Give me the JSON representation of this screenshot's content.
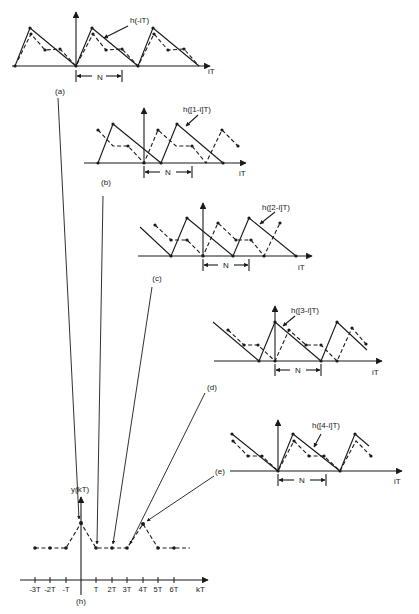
{
  "panels": [
    {
      "id": "a",
      "tag": "(a)",
      "label": "h(-iT)",
      "axis": "iT",
      "period": "N"
    },
    {
      "id": "b",
      "tag": "(b)",
      "label": "h([1-i]T)",
      "axis": "iT",
      "period": "N"
    },
    {
      "id": "c",
      "tag": "(c)",
      "label": "h([2-i]T)",
      "axis": "iT",
      "period": "N"
    },
    {
      "id": "d",
      "tag": "(d)",
      "label": "h([3-i]T)",
      "axis": "iT",
      "period": "N"
    },
    {
      "id": "e",
      "tag": "(e)",
      "label": "h([4-i]T)",
      "axis": "iT",
      "period": "N"
    }
  ],
  "output": {
    "tag": "(h)",
    "ylabel": "y(kT)",
    "xlabel": "kT",
    "ticks": [
      "-3T",
      "-2T",
      "-T",
      "T",
      "2T",
      "3T",
      "4T",
      "5T",
      "6T"
    ]
  },
  "colors": {
    "ink": "#1a1a1a",
    "background": "#ffffff"
  }
}
